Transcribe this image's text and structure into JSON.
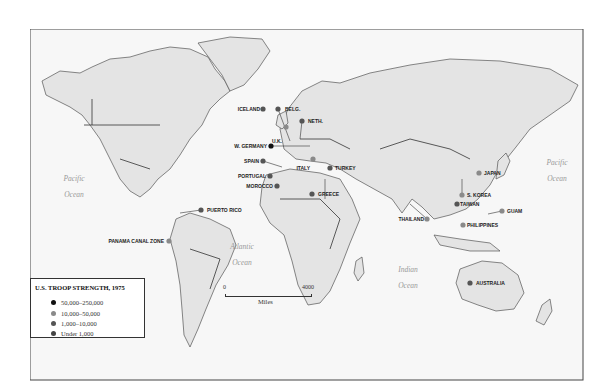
{
  "legend": {
    "title": "U.S. TROOP STRENGTH, 1975",
    "categories": [
      {
        "label": "50,000–250,000",
        "color": "#111111"
      },
      {
        "label": "10,000–50,000",
        "color": "#8a8a8a"
      },
      {
        "label": "1,000–10,000",
        "color": "#555555"
      },
      {
        "label": "Under 1,000",
        "color": "#444444"
      }
    ]
  },
  "scale": {
    "min_label": "0",
    "max_label": "4000",
    "unit": "Miles"
  },
  "oceans": [
    {
      "name": "Pacific",
      "line2": "Ocean",
      "region": "east-pacific"
    },
    {
      "name": "Pacific",
      "line2": "Ocean",
      "region": "west-pacific"
    },
    {
      "name": "Atlantic",
      "line2": "Ocean",
      "region": "atlantic"
    },
    {
      "name": "Indian",
      "line2": "Ocean",
      "region": "indian"
    }
  ],
  "locations": [
    {
      "name": "ICELAND",
      "category": "1,000–10,000"
    },
    {
      "name": "BELG.",
      "category": "1,000–10,000"
    },
    {
      "name": "NETH.",
      "category": "1,000–10,000"
    },
    {
      "name": "U.K.",
      "category": "10,000–50,000"
    },
    {
      "name": "W. GERMANY",
      "category": "50,000–250,000"
    },
    {
      "name": "SPAIN",
      "category": "1,000–10,000"
    },
    {
      "name": "PORTUGAL",
      "category": "1,000–10,000"
    },
    {
      "name": "MOROCCO",
      "category": "1,000–10,000"
    },
    {
      "name": "ITALY",
      "category": "10,000–50,000"
    },
    {
      "name": "TURKEY",
      "category": "1,000–10,000"
    },
    {
      "name": "GREECE",
      "category": "1,000–10,000"
    },
    {
      "name": "PUERTO RICO",
      "category": "1,000–10,000"
    },
    {
      "name": "PANAMA CANAL ZONE",
      "category": "10,000–50,000"
    },
    {
      "name": "JAPAN",
      "category": "10,000–50,000"
    },
    {
      "name": "S. KOREA",
      "category": "10,000–50,000"
    },
    {
      "name": "TAIWAN",
      "category": "1,000–10,000"
    },
    {
      "name": "GUAM",
      "category": "10,000–50,000"
    },
    {
      "name": "PHILIPPINES",
      "category": "10,000–50,000"
    },
    {
      "name": "THAILAND",
      "category": "10,000–50,000"
    },
    {
      "name": "AUSTRALIA",
      "category": "1,000–10,000"
    }
  ]
}
